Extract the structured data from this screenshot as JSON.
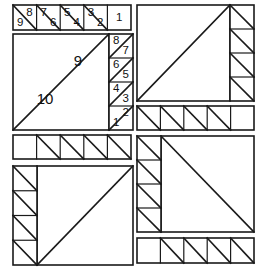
{
  "document": {
    "title": "Foundation Paper Piecing Pattern Sheet",
    "kind": "quilt-block-piecing-diagram",
    "canvas": {
      "width": 257,
      "height": 272,
      "background": "#ffffff"
    },
    "style": {
      "line_color": "#1a1a1a",
      "outline_width": 1.6,
      "inner_width": 1.2,
      "diagonal_width": 1.6,
      "label_color": "#111111"
    }
  },
  "units": [
    {
      "id": "top-numbered-strip",
      "name": "top-numbered-sawtooth-strip",
      "x": 13,
      "y": 5,
      "width": 118,
      "height": 25,
      "cells": [
        {
          "index": 0,
          "x": 13,
          "width": 23.6,
          "diagonal": "tl-br",
          "labels": [
            {
              "text": "9",
              "pos": "bottom-left"
            },
            {
              "text": "8",
              "pos": "top-right"
            }
          ]
        },
        {
          "index": 1,
          "x": 36.6,
          "width": 23.6,
          "diagonal": "tl-br",
          "labels": [
            {
              "text": "7",
              "pos": "top-left"
            },
            {
              "text": "6",
              "pos": "bottom-right"
            }
          ]
        },
        {
          "index": 2,
          "x": 60.2,
          "width": 23.6,
          "diagonal": "tl-br",
          "labels": [
            {
              "text": "5",
              "pos": "top-left"
            },
            {
              "text": "4",
              "pos": "bottom-right"
            }
          ]
        },
        {
          "index": 3,
          "x": 83.8,
          "width": 23.6,
          "diagonal": "tl-br",
          "labels": [
            {
              "text": "3",
              "pos": "top-left"
            },
            {
              "text": "2",
              "pos": "bottom-right"
            }
          ]
        },
        {
          "index": 4,
          "x": 107.4,
          "width": 23.6,
          "diagonal": "none",
          "labels": [
            {
              "text": "1",
              "pos": "center"
            }
          ]
        }
      ]
    },
    {
      "id": "main-numbered-block",
      "name": "main-numbered-half-square-block",
      "x": 13,
      "y": 34,
      "width": 120,
      "height": 96,
      "big_square": {
        "x": 13,
        "y": 34,
        "width": 96,
        "height": 96,
        "diagonal": "tr-bl"
      },
      "big_labels": [
        {
          "text": "9",
          "x": 78,
          "y": 62,
          "size": 15
        },
        {
          "text": "10",
          "x": 45,
          "y": 100,
          "size": 15
        }
      ],
      "side_strip": {
        "x": 109,
        "y": 34,
        "width": 24,
        "height": 96,
        "cells": [
          {
            "index": 0,
            "y": 34,
            "height": 24,
            "diagonal": "bl-tr",
            "labels": [
              {
                "text": "8",
                "pos": "top-left"
              },
              {
                "text": "7",
                "pos": "bottom-right"
              }
            ]
          },
          {
            "index": 1,
            "y": 58,
            "height": 24,
            "diagonal": "bl-tr",
            "labels": [
              {
                "text": "6",
                "pos": "top-left"
              },
              {
                "text": "5",
                "pos": "bottom-right"
              }
            ]
          },
          {
            "index": 2,
            "y": 82,
            "height": 24,
            "diagonal": "bl-tr",
            "labels": [
              {
                "text": "4",
                "pos": "top-left"
              },
              {
                "text": "3",
                "pos": "bottom-right"
              }
            ]
          },
          {
            "index": 3,
            "y": 106,
            "height": 24,
            "diagonal": "bl-tr",
            "labels": [
              {
                "text": "2",
                "pos": "top-right"
              },
              {
                "text": "1",
                "pos": "bottom-left"
              }
            ]
          }
        ]
      }
    },
    {
      "id": "top-right-block",
      "name": "top-right-half-square-block",
      "x": 137,
      "y": 5,
      "width": 117,
      "height": 96,
      "big_square": {
        "x": 137,
        "y": 5,
        "width": 93,
        "height": 96,
        "diagonal": "tr-bl"
      },
      "side_strip": {
        "x": 230,
        "y": 5,
        "width": 24,
        "height": 96,
        "side": "right",
        "cells": [
          {
            "index": 0,
            "y": 5,
            "height": 24,
            "diagonal": "tl-br"
          },
          {
            "index": 1,
            "y": 29,
            "height": 24,
            "diagonal": "tl-br"
          },
          {
            "index": 2,
            "y": 53,
            "height": 24,
            "diagonal": "tl-br"
          },
          {
            "index": 3,
            "y": 77,
            "height": 24,
            "diagonal": "tl-br"
          }
        ]
      }
    },
    {
      "id": "right-middle-strip",
      "name": "right-middle-sawtooth-strip",
      "x": 137,
      "y": 106,
      "width": 117,
      "height": 24,
      "blank_side": "right",
      "cells": [
        {
          "index": 0,
          "x": 137,
          "width": 23.4,
          "diagonal": "tl-br"
        },
        {
          "index": 1,
          "x": 160.4,
          "width": 23.4,
          "diagonal": "tl-br"
        },
        {
          "index": 2,
          "x": 183.8,
          "width": 23.4,
          "diagonal": "tl-br"
        },
        {
          "index": 3,
          "x": 207.2,
          "width": 23.4,
          "diagonal": "tl-br"
        },
        {
          "index": 4,
          "x": 230.6,
          "width": 23.4,
          "diagonal": "none"
        }
      ]
    },
    {
      "id": "left-middle-strip",
      "name": "left-middle-sawtooth-strip",
      "x": 13,
      "y": 135,
      "width": 118,
      "height": 24,
      "blank_side": "left",
      "cells": [
        {
          "index": 0,
          "x": 13,
          "width": 23.6,
          "diagonal": "none"
        },
        {
          "index": 1,
          "x": 36.6,
          "width": 23.6,
          "diagonal": "tl-br"
        },
        {
          "index": 2,
          "x": 60.2,
          "width": 23.6,
          "diagonal": "tl-br"
        },
        {
          "index": 3,
          "x": 83.8,
          "width": 23.6,
          "diagonal": "tl-br"
        },
        {
          "index": 4,
          "x": 107.4,
          "width": 23.6,
          "diagonal": "tl-br"
        }
      ]
    },
    {
      "id": "bottom-left-block",
      "name": "bottom-left-half-square-block",
      "x": 13,
      "y": 166,
      "width": 120,
      "height": 99,
      "big_square": {
        "x": 37,
        "y": 166,
        "width": 96,
        "height": 99,
        "diagonal": "tr-bl"
      },
      "side_strip": {
        "x": 13,
        "y": 166,
        "width": 24,
        "height": 99,
        "side": "left",
        "cells": [
          {
            "index": 0,
            "y": 166,
            "height": 24.75,
            "diagonal": "tl-br"
          },
          {
            "index": 1,
            "y": 190.75,
            "height": 24.75,
            "diagonal": "tl-br"
          },
          {
            "index": 2,
            "y": 215.5,
            "height": 24.75,
            "diagonal": "tl-br"
          },
          {
            "index": 3,
            "y": 240.25,
            "height": 24.75,
            "diagonal": "tl-br"
          }
        ]
      }
    },
    {
      "id": "bottom-right-block",
      "name": "bottom-right-half-square-block",
      "x": 137,
      "y": 136,
      "width": 117,
      "height": 96,
      "big_square": {
        "x": 161,
        "y": 136,
        "width": 93,
        "height": 96,
        "diagonal": "tl-br"
      },
      "side_strip": {
        "x": 137,
        "y": 136,
        "width": 24,
        "height": 96,
        "side": "left",
        "cells": [
          {
            "index": 0,
            "y": 136,
            "height": 24,
            "diagonal": "tl-br"
          },
          {
            "index": 1,
            "y": 160,
            "height": 24,
            "diagonal": "tl-br"
          },
          {
            "index": 2,
            "y": 184,
            "height": 24,
            "diagonal": "tl-br"
          },
          {
            "index": 3,
            "y": 208,
            "height": 24,
            "diagonal": "tl-br"
          }
        ]
      }
    },
    {
      "id": "bottom-right-strip",
      "name": "bottom-right-sawtooth-strip",
      "x": 137,
      "y": 238,
      "width": 117,
      "height": 25,
      "blank_side": "left",
      "cells": [
        {
          "index": 0,
          "x": 137,
          "width": 23.4,
          "diagonal": "none"
        },
        {
          "index": 1,
          "x": 160.4,
          "width": 23.4,
          "diagonal": "tl-br"
        },
        {
          "index": 2,
          "x": 183.8,
          "width": 23.4,
          "diagonal": "tl-br"
        },
        {
          "index": 3,
          "x": 207.2,
          "width": 23.4,
          "diagonal": "tl-br"
        },
        {
          "index": 4,
          "x": 230.6,
          "width": 23.4,
          "diagonal": "tl-br"
        }
      ]
    }
  ],
  "all_labels": [
    "1",
    "2",
    "3",
    "4",
    "5",
    "6",
    "7",
    "8",
    "9",
    "10"
  ]
}
